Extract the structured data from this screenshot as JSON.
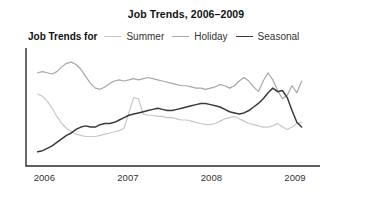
{
  "chart_data": {
    "type": "line",
    "title": "Job Trends, 2006–2009",
    "xlabel": "",
    "ylabel": "",
    "grid": false,
    "legend_position": "top-left",
    "legend_lead_label": "Job Trends for",
    "x_tick_labels": [
      "2006",
      "2007",
      "2008",
      "2009"
    ],
    "x_tick_values": [
      2006,
      2007,
      2008,
      2009
    ],
    "xlim": [
      2005.78,
      2009.3
    ],
    "ylim": [
      0,
      100
    ],
    "axis_color": "#2b2b2b",
    "background_color": "#ffffff",
    "series": [
      {
        "name": "Summer",
        "color": "#c8c8c8",
        "values": [
          61,
          59,
          55,
          49,
          42,
          36,
          32,
          29,
          27,
          26,
          25,
          25,
          25,
          26,
          27,
          28,
          29,
          30,
          32,
          45,
          58,
          57,
          44,
          43,
          43,
          42,
          42,
          41,
          41,
          40,
          39,
          39,
          38,
          37,
          36,
          35,
          35,
          36,
          38,
          40,
          41,
          42,
          40,
          38,
          36,
          35,
          34,
          33,
          33,
          34,
          36,
          33,
          31,
          33,
          36,
          37
        ]
      },
      {
        "name": "Holiday",
        "color": "#a8a8a8",
        "values": [
          79,
          80,
          79,
          78,
          80,
          84,
          87,
          88,
          86,
          82,
          76,
          70,
          66,
          65,
          67,
          70,
          72,
          73,
          72,
          73,
          74,
          73,
          74,
          75,
          74,
          73,
          72,
          71,
          70,
          69,
          68,
          68,
          67,
          66,
          66,
          65,
          66,
          67,
          69,
          68,
          66,
          68,
          72,
          75,
          72,
          67,
          63,
          72,
          79,
          73,
          64,
          57,
          60,
          68,
          62,
          72
        ]
      },
      {
        "name": "Seasonal",
        "color": "#3a3a3a",
        "values": [
          12,
          13,
          15,
          17,
          20,
          23,
          26,
          28,
          31,
          33,
          34,
          33,
          33,
          35,
          36,
          36,
          37,
          39,
          41,
          43,
          44,
          45,
          46,
          47,
          48,
          49,
          48,
          47,
          47,
          48,
          49,
          50,
          51,
          52,
          53,
          53,
          52,
          51,
          50,
          48,
          46,
          45,
          44,
          45,
          47,
          50,
          53,
          57,
          62,
          66,
          63,
          64,
          58,
          47,
          37,
          33
        ]
      }
    ]
  }
}
